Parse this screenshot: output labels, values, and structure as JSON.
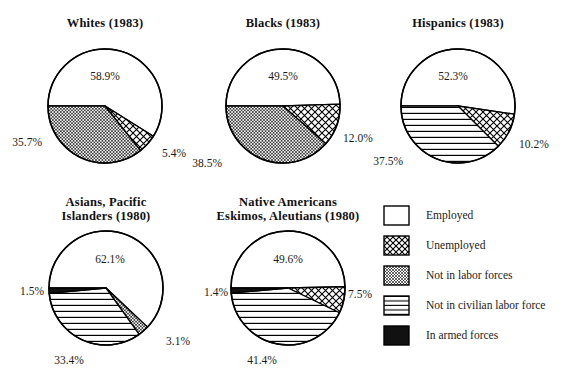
{
  "figure": {
    "background_color": "#ffffff",
    "line_color": "#000000",
    "text_color": "#1a1a1a"
  },
  "legend": {
    "name": "legend",
    "items": [
      {
        "label": "Employed",
        "pattern": "solid-white",
        "swatch_name": "legend-swatch-employed"
      },
      {
        "label": "Unemployed",
        "pattern": "large-crosshatch",
        "swatch_name": "legend-swatch-unemployed"
      },
      {
        "label": "Not in labor forces",
        "pattern": "fine-crosshatch",
        "swatch_name": "legend-swatch-not-in-labor-forces"
      },
      {
        "label": "Not in civilian labor force",
        "pattern": "horizontal-lines",
        "swatch_name": "legend-swatch-not-in-civilian-labor-force"
      },
      {
        "label": "In armed forces",
        "pattern": "solid-black",
        "swatch_name": "legend-swatch-in-armed-forces"
      }
    ]
  },
  "chart_data": [
    {
      "type": "pie",
      "title": "Whites (1983)",
      "title_lines": [
        "Whites (1983)"
      ],
      "categories": [
        "Employed",
        "Unemployed",
        "Not in labor forces"
      ],
      "values": [
        58.9,
        5.4,
        35.7
      ],
      "labels": [
        "58.9%",
        "5.4%",
        "35.7%"
      ],
      "patterns": [
        "solid-white",
        "large-crosshatch",
        "fine-crosshatch"
      ]
    },
    {
      "type": "pie",
      "title": "Blacks (1983)",
      "title_lines": [
        "Blacks (1983)"
      ],
      "categories": [
        "Employed",
        "Unemployed",
        "Not in labor forces"
      ],
      "values": [
        49.5,
        12.0,
        38.5
      ],
      "labels": [
        "49.5%",
        "12.0%",
        "38.5%"
      ],
      "patterns": [
        "solid-white",
        "large-crosshatch",
        "fine-crosshatch"
      ]
    },
    {
      "type": "pie",
      "title": "Hispanics (1983)",
      "title_lines": [
        "Hispanics (1983)"
      ],
      "categories": [
        "Employed",
        "Unemployed",
        "Not in civilian labor force"
      ],
      "values": [
        52.3,
        10.2,
        37.5
      ],
      "labels": [
        "52.3%",
        "10.2%",
        "37.5%"
      ],
      "patterns": [
        "solid-white",
        "large-crosshatch",
        "horizontal-lines"
      ]
    },
    {
      "type": "pie",
      "title": "Asians, Pacific Islanders (1980)",
      "title_lines": [
        "Asians, Pacific",
        "Islanders (1980)"
      ],
      "categories": [
        "Employed",
        "Unemployed",
        "Not in civilian labor force",
        "In armed forces"
      ],
      "values": [
        62.1,
        3.1,
        33.4,
        1.5
      ],
      "labels": [
        "62.1%",
        "3.1%",
        "33.4%",
        "1.5%"
      ],
      "patterns": [
        "solid-white",
        "fine-crosshatch",
        "horizontal-lines",
        "solid-black"
      ]
    },
    {
      "type": "pie",
      "title": "Native Americans Eskimos, Aleutians (1980)",
      "title_lines": [
        "Native Americans",
        "Eskimos, Aleutians (1980)"
      ],
      "categories": [
        "Employed",
        "Unemployed",
        "Not in civilian labor force",
        "In armed forces"
      ],
      "values": [
        49.6,
        7.5,
        41.4,
        1.4
      ],
      "labels": [
        "49.6%",
        "7.5%",
        "41.4%",
        "1.4%"
      ],
      "patterns": [
        "solid-white",
        "large-crosshatch",
        "horizontal-lines",
        "solid-black"
      ]
    }
  ]
}
